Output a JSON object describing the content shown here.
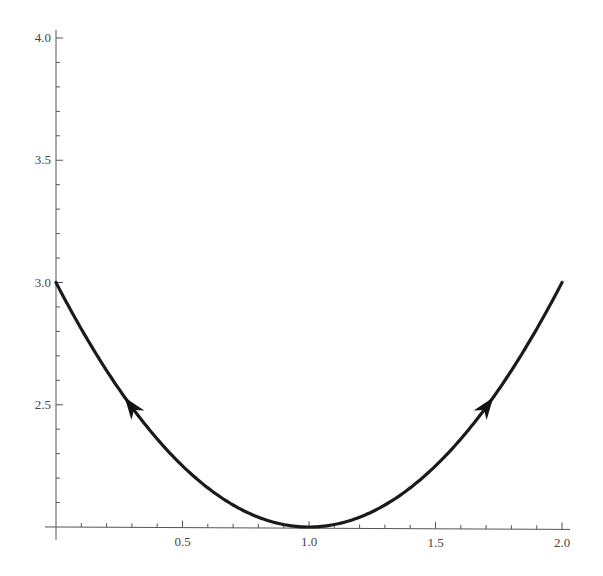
{
  "chart_data": {
    "type": "line",
    "title": "",
    "xlabel": "",
    "ylabel": "",
    "xlim": [
      0,
      2
    ],
    "ylim": [
      2,
      4
    ],
    "grid": false,
    "legend": null,
    "function": "y = (x - 1)^2 + 2",
    "x_ticks": [
      {
        "value": 0.5,
        "label": "0.5"
      },
      {
        "value": 1.0,
        "label": "1.0"
      },
      {
        "value": 1.5,
        "label": "1.5"
      },
      {
        "value": 2.0,
        "label": "2.0"
      }
    ],
    "y_ticks": [
      {
        "value": 2.5,
        "label": "2.5"
      },
      {
        "value": 3.0,
        "label": "3.0"
      },
      {
        "value": 3.5,
        "label": "3.5"
      },
      {
        "value": 4.0,
        "label": "4.0"
      }
    ],
    "minor_tick_step": 0.1,
    "series": [
      {
        "name": "parabola",
        "color": "#1a1a1a",
        "x": [
          0.0,
          0.1,
          0.2,
          0.3,
          0.4,
          0.5,
          0.6,
          0.7,
          0.8,
          0.9,
          1.0,
          1.1,
          1.2,
          1.3,
          1.4,
          1.5,
          1.6,
          1.7,
          1.8,
          1.9,
          2.0
        ],
        "y": [
          4.0,
          3.81,
          3.64,
          3.49,
          3.36,
          3.25,
          3.16,
          3.09,
          3.04,
          3.01,
          3.0,
          3.01,
          3.04,
          3.09,
          3.16,
          3.25,
          3.36,
          3.49,
          3.64,
          3.81,
          4.0
        ]
      }
    ],
    "annotations": [
      {
        "type": "arrow",
        "at_x": 0.3,
        "at_y": 2.95,
        "direction": "up-left (toward decreasing x)"
      },
      {
        "type": "arrow",
        "at_x": 1.7,
        "at_y": 2.95,
        "direction": "up-right (toward increasing x)"
      }
    ]
  }
}
